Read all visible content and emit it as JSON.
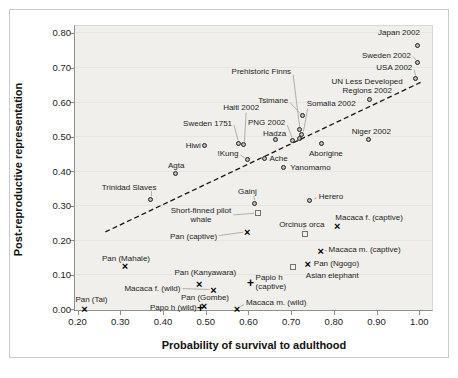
{
  "chart_data": {
    "type": "scatter",
    "title": "",
    "xlabel": "Probability of survival to adulthood",
    "ylabel": "Post-reproductive representation",
    "xlim": [
      0.2,
      1.0
    ],
    "ylim": [
      0.0,
      0.8
    ],
    "x_ticks": [
      "0.20",
      "0.30",
      "0.40",
      "0.50",
      "0.60",
      "0.70",
      "0.80",
      "0.90",
      "1.00"
    ],
    "y_ticks": [
      "0.00",
      "0.10",
      "0.20",
      "0.30",
      "0.40",
      "0.50",
      "0.60",
      "0.70",
      "0.80"
    ],
    "grid": "faint-horizontal",
    "legend": "none",
    "trend_line": {
      "style": "dashed",
      "from": {
        "x": 0.265,
        "y": 0.224
      },
      "to": {
        "x": 1.003,
        "y": 0.657
      }
    },
    "marker_colors": {
      "circle": "#222120",
      "square": "#73736d",
      "x": "#000000",
      "plus": "#000000"
    },
    "plot_bg": "#f0efeb",
    "series": [
      {
        "name": "Human populations",
        "marker": "circle",
        "points": [
          {
            "label": "Japan 2002",
            "x": 0.999,
            "y": 0.76,
            "anchor": "right",
            "dx": 1,
            "dy": -14
          },
          {
            "label": "Sweden 2002",
            "x": 0.999,
            "y": 0.712,
            "anchor": "right",
            "dx": -8,
            "dy": -8,
            "leader": [
              -6,
              -7
            ]
          },
          {
            "label": "USA 2002",
            "x": 0.993,
            "y": 0.665,
            "anchor": "right",
            "dx": -4,
            "dy": -12,
            "leader": [
              -2,
              -10
            ]
          },
          {
            "label": "UN Less Developed\nRegions 2002",
            "x": 0.885,
            "y": 0.606,
            "anchor": "center",
            "dx": -3,
            "dy": -14
          },
          {
            "label": "Tsimane",
            "x": 0.728,
            "y": 0.558,
            "anchor": "right",
            "dx": -15,
            "dy": -16,
            "leader": [
              -13,
              -14
            ]
          },
          {
            "label": "Prehistoric Finns",
            "x": 0.721,
            "y": 0.517,
            "anchor": "right",
            "dx": -9,
            "dy": -59,
            "leader": [
              -7,
              -56
            ]
          },
          {
            "label": "Somalia 2002",
            "x": 0.727,
            "y": 0.503,
            "anchor": "left",
            "dx": 4,
            "dy": -32,
            "leader": [
              5,
              -27
            ]
          },
          {
            "label": "PNG 2002",
            "x": 0.705,
            "y": 0.487,
            "anchor": "right",
            "dx": -8,
            "dy": -19,
            "leader": [
              -6,
              -16
            ]
          },
          {
            "label": "",
            "x": 0.722,
            "y": 0.491
          },
          {
            "label": "Hadza",
            "x": 0.666,
            "y": 0.488,
            "anchor": "center",
            "dx": -2,
            "dy": -7
          },
          {
            "label": "Haiti 2002",
            "x": 0.59,
            "y": 0.474,
            "anchor": "center",
            "dx": -3,
            "dy": -38,
            "leader": [
              2,
              -33
            ]
          },
          {
            "label": "Sweden 1751",
            "x": 0.578,
            "y": 0.478,
            "anchor": "right",
            "dx": -7,
            "dy": -21,
            "leader": [
              -5,
              -19
            ]
          },
          {
            "label": "Hiwi",
            "x": 0.5,
            "y": 0.473,
            "anchor": "right",
            "dx": -5,
            "dy": 0
          },
          {
            "label": "!Kung",
            "x": 0.6,
            "y": 0.432,
            "anchor": "right",
            "dx": -10,
            "dy": -7,
            "leader": [
              -8,
              -5
            ]
          },
          {
            "label": "Ache",
            "x": 0.64,
            "y": 0.434,
            "anchor": "left",
            "dx": 4,
            "dy": -1
          },
          {
            "label": "Agta",
            "x": 0.431,
            "y": 0.392,
            "anchor": "center",
            "dx": 0,
            "dy": -8
          },
          {
            "label": "Aborigine",
            "x": 0.772,
            "y": 0.476,
            "anchor": "center",
            "dx": 4,
            "dy": 9
          },
          {
            "label": "Yanomamo",
            "x": 0.684,
            "y": 0.408,
            "anchor": "left",
            "dx": 6,
            "dy": -1
          },
          {
            "label": "Niger 2002",
            "x": 0.883,
            "y": 0.489,
            "anchor": "center",
            "dx": 2,
            "dy": -9
          },
          {
            "label": "Trinidad Slaves",
            "x": 0.373,
            "y": 0.316,
            "anchor": "right",
            "dx": 5,
            "dy": -13,
            "leader": [
              0,
              -9
            ]
          },
          {
            "label": "Gainj",
            "x": 0.617,
            "y": 0.305,
            "anchor": "right",
            "dx": 1,
            "dy": -12,
            "leader": [
              -2,
              -8
            ]
          },
          {
            "label": "Herero",
            "x": 0.746,
            "y": 0.312,
            "anchor": "left",
            "dx": 8,
            "dy": -5,
            "leader": [
              6,
              -4
            ]
          }
        ]
      },
      {
        "name": "Whales and elephant",
        "marker": "square",
        "points": [
          {
            "label": "Short-finned pilot\nwhale",
            "x": 0.623,
            "y": 0.279,
            "anchor": "right",
            "dx": -27,
            "dy": 2,
            "talign": "center",
            "leader": [
              -25,
              2
            ]
          },
          {
            "label": "Orcinus orca",
            "x": 0.732,
            "y": 0.218,
            "anchor": "center",
            "dx": -3,
            "dy": -10,
            "leader": [
              -1,
              -7
            ]
          },
          {
            "label": "Asian elephant",
            "x": 0.704,
            "y": 0.123,
            "anchor": "left",
            "dx": 13,
            "dy": 9
          }
        ]
      },
      {
        "name": "Primates (x markers)",
        "marker": "x",
        "points": [
          {
            "label": "Pan (captive)",
            "x": 0.597,
            "y": 0.225,
            "anchor": "right",
            "dx": -30,
            "dy": 5,
            "leader": [
              -28,
              4
            ]
          },
          {
            "label": "Macaca f. (captive)",
            "x": 0.808,
            "y": 0.242,
            "anchor": "left",
            "dx": -2,
            "dy": -8
          },
          {
            "label": "Macaca m. (captive)",
            "x": 0.769,
            "y": 0.17,
            "anchor": "left",
            "dx": 8,
            "dy": -1,
            "leader": [
              6,
              0
            ]
          },
          {
            "label": "Pan (Ngogo)",
            "x": 0.739,
            "y": 0.131,
            "anchor": "left",
            "dx": 6,
            "dy": -1
          },
          {
            "label": "Pan (Mahale)",
            "x": 0.311,
            "y": 0.125,
            "anchor": "center",
            "dx": 1,
            "dy": -8
          },
          {
            "label": "Pan (Kanyawara)",
            "x": 0.485,
            "y": 0.073,
            "anchor": "center",
            "dx": 6,
            "dy": -12
          },
          {
            "label": "Macaca f. (wild)",
            "x": 0.518,
            "y": 0.057,
            "anchor": "right",
            "dx": -33,
            "dy": -1,
            "leader": [
              -31,
              -1
            ]
          },
          {
            "label": "Pan (Gombe)",
            "x": 0.496,
            "y": 0.01,
            "anchor": "center",
            "dx": 1,
            "dy": -8
          },
          {
            "label": "Macaca m. (wild)",
            "x": 0.573,
            "y": 0.002,
            "anchor": "left",
            "dx": 9,
            "dy": -6,
            "leader": [
              7,
              -4
            ]
          },
          {
            "label": "Pan (Tai)",
            "x": 0.216,
            "y": 0.001,
            "anchor": "center",
            "dx": 7,
            "dy": -9
          }
        ]
      },
      {
        "name": "Papio (plus markers)",
        "marker": "plus",
        "points": [
          {
            "label": "Papio h\n(captive)",
            "x": 0.605,
            "y": 0.077,
            "anchor": "left",
            "dx": 5,
            "dy": -1,
            "talign": "left"
          },
          {
            "label": "Papo h (wild)",
            "x": 0.488,
            "y": 0.005,
            "anchor": "right",
            "dx": -4,
            "dy": 0
          }
        ]
      }
    ]
  }
}
